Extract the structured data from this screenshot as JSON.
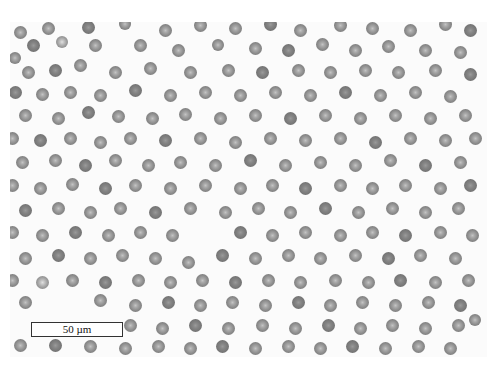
{
  "image": {
    "subject": "blood smear micrograph (red blood cells)",
    "background_color": "#fbfbfb",
    "cell_color": "#8b8b8b",
    "cell_center_color": "#c4c4c4"
  },
  "scale_bar": {
    "label": "50 µm"
  },
  "cells": [
    [
      20,
      32,
      13,
      0
    ],
    [
      48,
      28,
      13,
      0
    ],
    [
      88,
      27,
      13,
      1
    ],
    [
      125,
      24,
      12,
      0
    ],
    [
      165,
      30,
      13,
      0
    ],
    [
      200,
      25,
      13,
      0
    ],
    [
      235,
      28,
      13,
      0
    ],
    [
      270,
      24,
      13,
      1
    ],
    [
      300,
      30,
      13,
      0
    ],
    [
      340,
      25,
      13,
      0
    ],
    [
      372,
      28,
      13,
      0
    ],
    [
      410,
      30,
      13,
      0
    ],
    [
      445,
      24,
      13,
      0
    ],
    [
      470,
      30,
      13,
      1
    ],
    [
      15,
      58,
      12,
      0
    ],
    [
      33,
      45,
      13,
      1
    ],
    [
      62,
      42,
      12,
      2
    ],
    [
      95,
      45,
      13,
      0
    ],
    [
      140,
      45,
      13,
      0
    ],
    [
      178,
      50,
      13,
      0
    ],
    [
      218,
      45,
      12,
      0
    ],
    [
      255,
      48,
      13,
      0
    ],
    [
      288,
      50,
      13,
      1
    ],
    [
      322,
      44,
      13,
      0
    ],
    [
      355,
      50,
      13,
      0
    ],
    [
      388,
      46,
      13,
      0
    ],
    [
      425,
      50,
      13,
      0
    ],
    [
      460,
      52,
      13,
      0
    ],
    [
      28,
      72,
      13,
      0
    ],
    [
      55,
      70,
      13,
      1
    ],
    [
      80,
      65,
      13,
      0
    ],
    [
      115,
      72,
      13,
      0
    ],
    [
      150,
      68,
      13,
      0
    ],
    [
      190,
      72,
      13,
      0
    ],
    [
      228,
      70,
      13,
      0
    ],
    [
      262,
      72,
      13,
      1
    ],
    [
      298,
      70,
      13,
      0
    ],
    [
      330,
      72,
      13,
      0
    ],
    [
      365,
      70,
      13,
      0
    ],
    [
      398,
      72,
      13,
      0
    ],
    [
      435,
      70,
      13,
      0
    ],
    [
      470,
      74,
      13,
      1
    ],
    [
      15,
      92,
      13,
      1
    ],
    [
      42,
      94,
      13,
      0
    ],
    [
      70,
      92,
      13,
      0
    ],
    [
      100,
      95,
      13,
      0
    ],
    [
      135,
      90,
      13,
      1
    ],
    [
      170,
      95,
      13,
      0
    ],
    [
      205,
      92,
      13,
      0
    ],
    [
      240,
      95,
      13,
      0
    ],
    [
      275,
      92,
      13,
      0
    ],
    [
      310,
      95,
      13,
      0
    ],
    [
      345,
      92,
      13,
      1
    ],
    [
      380,
      95,
      13,
      0
    ],
    [
      415,
      92,
      13,
      0
    ],
    [
      450,
      96,
      13,
      0
    ],
    [
      25,
      115,
      13,
      0
    ],
    [
      58,
      118,
      13,
      0
    ],
    [
      88,
      112,
      13,
      1
    ],
    [
      118,
      116,
      13,
      0
    ],
    [
      152,
      118,
      13,
      0
    ],
    [
      185,
      114,
      13,
      0
    ],
    [
      220,
      118,
      13,
      0
    ],
    [
      255,
      115,
      13,
      0
    ],
    [
      290,
      118,
      13,
      1
    ],
    [
      325,
      115,
      13,
      0
    ],
    [
      360,
      118,
      13,
      0
    ],
    [
      395,
      115,
      13,
      0
    ],
    [
      430,
      118,
      13,
      0
    ],
    [
      465,
      115,
      13,
      0
    ],
    [
      12,
      138,
      13,
      0
    ],
    [
      40,
      140,
      13,
      1
    ],
    [
      70,
      138,
      13,
      0
    ],
    [
      100,
      142,
      13,
      0
    ],
    [
      130,
      138,
      13,
      0
    ],
    [
      165,
      140,
      13,
      1
    ],
    [
      200,
      138,
      13,
      0
    ],
    [
      235,
      142,
      13,
      0
    ],
    [
      270,
      138,
      13,
      0
    ],
    [
      305,
      140,
      13,
      0
    ],
    [
      340,
      138,
      13,
      0
    ],
    [
      375,
      142,
      13,
      1
    ],
    [
      410,
      138,
      13,
      0
    ],
    [
      445,
      140,
      13,
      0
    ],
    [
      475,
      138,
      13,
      0
    ],
    [
      22,
      162,
      13,
      0
    ],
    [
      55,
      160,
      13,
      0
    ],
    [
      85,
      165,
      13,
      1
    ],
    [
      115,
      160,
      13,
      0
    ],
    [
      148,
      165,
      13,
      0
    ],
    [
      180,
      162,
      13,
      0
    ],
    [
      215,
      165,
      13,
      0
    ],
    [
      250,
      160,
      13,
      1
    ],
    [
      285,
      165,
      13,
      0
    ],
    [
      320,
      162,
      13,
      0
    ],
    [
      355,
      165,
      13,
      0
    ],
    [
      390,
      160,
      13,
      0
    ],
    [
      425,
      165,
      13,
      1
    ],
    [
      460,
      162,
      13,
      0
    ],
    [
      12,
      185,
      13,
      0
    ],
    [
      40,
      188,
      13,
      0
    ],
    [
      72,
      184,
      13,
      0
    ],
    [
      105,
      188,
      13,
      1
    ],
    [
      135,
      185,
      13,
      0
    ],
    [
      170,
      188,
      13,
      0
    ],
    [
      205,
      185,
      13,
      0
    ],
    [
      240,
      188,
      13,
      0
    ],
    [
      272,
      185,
      13,
      0
    ],
    [
      305,
      188,
      13,
      1
    ],
    [
      340,
      185,
      13,
      0
    ],
    [
      372,
      188,
      13,
      0
    ],
    [
      405,
      185,
      13,
      0
    ],
    [
      440,
      188,
      13,
      0
    ],
    [
      470,
      185,
      13,
      1
    ],
    [
      25,
      210,
      13,
      1
    ],
    [
      58,
      208,
      13,
      0
    ],
    [
      90,
      212,
      13,
      0
    ],
    [
      120,
      208,
      13,
      0
    ],
    [
      155,
      212,
      13,
      1
    ],
    [
      190,
      208,
      13,
      0
    ],
    [
      225,
      212,
      13,
      0
    ],
    [
      258,
      208,
      13,
      0
    ],
    [
      290,
      212,
      13,
      0
    ],
    [
      325,
      208,
      13,
      1
    ],
    [
      358,
      212,
      13,
      0
    ],
    [
      392,
      208,
      13,
      0
    ],
    [
      425,
      212,
      13,
      0
    ],
    [
      458,
      208,
      13,
      0
    ],
    [
      12,
      232,
      13,
      0
    ],
    [
      42,
      235,
      13,
      0
    ],
    [
      75,
      232,
      13,
      1
    ],
    [
      108,
      235,
      13,
      0
    ],
    [
      140,
      232,
      13,
      0
    ],
    [
      172,
      235,
      13,
      0
    ],
    [
      240,
      232,
      13,
      1
    ],
    [
      272,
      235,
      13,
      0
    ],
    [
      305,
      232,
      13,
      0
    ],
    [
      340,
      235,
      13,
      0
    ],
    [
      372,
      232,
      13,
      0
    ],
    [
      405,
      235,
      13,
      1
    ],
    [
      440,
      232,
      13,
      0
    ],
    [
      472,
      235,
      13,
      0
    ],
    [
      25,
      258,
      13,
      0
    ],
    [
      58,
      255,
      13,
      1
    ],
    [
      90,
      258,
      13,
      0
    ],
    [
      122,
      255,
      13,
      0
    ],
    [
      155,
      258,
      13,
      0
    ],
    [
      188,
      262,
      13,
      0
    ],
    [
      222,
      255,
      13,
      1
    ],
    [
      255,
      258,
      13,
      0
    ],
    [
      288,
      255,
      13,
      0
    ],
    [
      320,
      258,
      13,
      0
    ],
    [
      355,
      255,
      13,
      0
    ],
    [
      388,
      258,
      13,
      1
    ],
    [
      420,
      255,
      13,
      0
    ],
    [
      455,
      258,
      13,
      0
    ],
    [
      12,
      280,
      13,
      0
    ],
    [
      42,
      282,
      13,
      2
    ],
    [
      72,
      280,
      13,
      0
    ],
    [
      105,
      282,
      13,
      1
    ],
    [
      138,
      280,
      13,
      0
    ],
    [
      170,
      282,
      13,
      0
    ],
    [
      202,
      280,
      13,
      0
    ],
    [
      235,
      282,
      13,
      1
    ],
    [
      268,
      280,
      13,
      0
    ],
    [
      300,
      282,
      13,
      0
    ],
    [
      335,
      280,
      13,
      0
    ],
    [
      368,
      282,
      13,
      0
    ],
    [
      400,
      280,
      13,
      1
    ],
    [
      435,
      282,
      13,
      0
    ],
    [
      468,
      280,
      13,
      0
    ],
    [
      25,
      302,
      13,
      0
    ],
    [
      100,
      300,
      13,
      0
    ],
    [
      135,
      305,
      13,
      0
    ],
    [
      168,
      302,
      13,
      1
    ],
    [
      200,
      305,
      13,
      0
    ],
    [
      232,
      302,
      13,
      0
    ],
    [
      265,
      305,
      13,
      0
    ],
    [
      298,
      302,
      13,
      1
    ],
    [
      330,
      305,
      13,
      0
    ],
    [
      362,
      302,
      13,
      0
    ],
    [
      395,
      305,
      13,
      0
    ],
    [
      428,
      302,
      13,
      0
    ],
    [
      460,
      305,
      13,
      1
    ],
    [
      130,
      325,
      13,
      0
    ],
    [
      162,
      328,
      13,
      0
    ],
    [
      195,
      325,
      13,
      1
    ],
    [
      228,
      328,
      13,
      0
    ],
    [
      262,
      325,
      13,
      0
    ],
    [
      295,
      328,
      13,
      0
    ],
    [
      328,
      325,
      13,
      1
    ],
    [
      360,
      328,
      13,
      0
    ],
    [
      392,
      325,
      13,
      0
    ],
    [
      425,
      328,
      13,
      0
    ],
    [
      458,
      325,
      13,
      0
    ],
    [
      475,
      320,
      12,
      0
    ],
    [
      20,
      345,
      13,
      0
    ],
    [
      55,
      345,
      13,
      1
    ],
    [
      90,
      346,
      13,
      0
    ],
    [
      125,
      348,
      13,
      0
    ],
    [
      158,
      346,
      13,
      0
    ],
    [
      190,
      348,
      13,
      0
    ],
    [
      222,
      346,
      13,
      1
    ],
    [
      255,
      348,
      13,
      0
    ],
    [
      288,
      346,
      13,
      0
    ],
    [
      320,
      348,
      13,
      0
    ],
    [
      352,
      346,
      13,
      1
    ],
    [
      385,
      348,
      13,
      0
    ],
    [
      418,
      346,
      13,
      0
    ],
    [
      450,
      348,
      13,
      0
    ]
  ]
}
